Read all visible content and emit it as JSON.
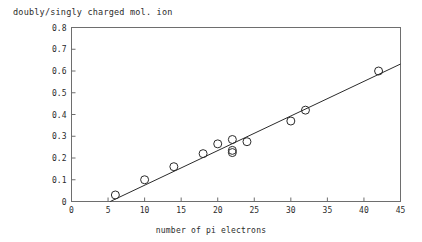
{
  "chart_data": {
    "type": "scatter",
    "title": "doubly/singly charged mol. ion",
    "subtitle": "",
    "xlabel": "number of pi electrons",
    "ylabel": "",
    "xlim": [
      0,
      45
    ],
    "ylim": [
      0,
      0.8
    ],
    "xticks": [
      0,
      5,
      10,
      15,
      20,
      25,
      30,
      35,
      40,
      45
    ],
    "xtick_labels": [
      "0",
      "5",
      "10",
      "15",
      "20",
      "25",
      "30",
      "35",
      "40",
      "45"
    ],
    "yticks": [
      0,
      0.1,
      0.2,
      0.3,
      0.4,
      0.5,
      0.6,
      0.7,
      0.8
    ],
    "ytick_labels": [
      "0",
      "0.1",
      "0.2",
      "0.3",
      "0.4",
      "0.5",
      "0.6",
      "0.7",
      "0.8"
    ],
    "grid": false,
    "legend": false,
    "marker": "open-circle",
    "marker_color": "#2b2b2b",
    "line_color": "#2b2b2b",
    "frame_color": "#6e6e6e",
    "series": [
      {
        "name": "doubly/singly charged mol. ion",
        "x": [
          6,
          10,
          14,
          18,
          20,
          22,
          22,
          22,
          24,
          30,
          32,
          42
        ],
        "y": [
          0.03,
          0.1,
          0.16,
          0.22,
          0.265,
          0.285,
          0.235,
          0.225,
          0.275,
          0.37,
          0.42,
          0.6
        ]
      }
    ],
    "fit_line": {
      "name": "linear fit",
      "x": [
        5.3,
        45
      ],
      "y": [
        0.0,
        0.632
      ]
    }
  }
}
